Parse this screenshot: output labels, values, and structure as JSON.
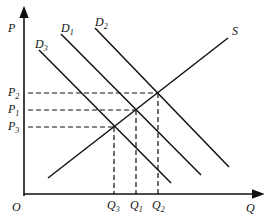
{
  "diagram": {
    "type": "supply-demand",
    "axes": {
      "y_label": "P",
      "x_label": "Q",
      "origin_label": "O"
    },
    "curves": {
      "supply": {
        "label": "S"
      },
      "demand": [
        {
          "label": "D",
          "sub": "3"
        },
        {
          "label": "D",
          "sub": "1"
        },
        {
          "label": "D",
          "sub": "2"
        }
      ]
    },
    "price_levels": [
      {
        "label": "P",
        "sub": "2"
      },
      {
        "label": "P",
        "sub": "1"
      },
      {
        "label": "P",
        "sub": "3"
      }
    ],
    "quantity_levels": [
      {
        "label": "Q",
        "sub": "3"
      },
      {
        "label": "Q",
        "sub": "1"
      },
      {
        "label": "Q",
        "sub": "2"
      }
    ],
    "colors": {
      "line": "#111111",
      "background": "#ffffff"
    }
  }
}
